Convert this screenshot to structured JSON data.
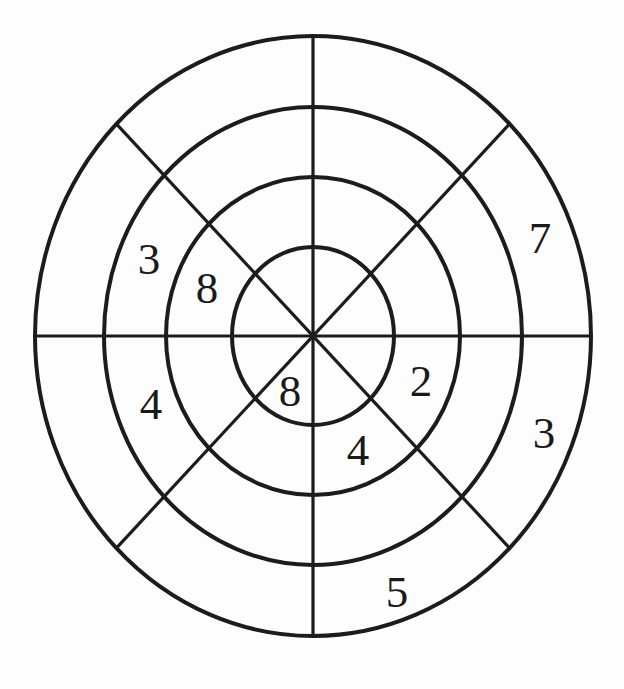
{
  "figure": {
    "type": "concentric-target-diagram",
    "rings": 4,
    "sectors": 8,
    "colors": {
      "line": "#1c1c1c",
      "text": "#1a1a1a",
      "background": "#fdfdfd"
    },
    "labels": [
      {
        "value": "3",
        "ring": 3,
        "sector": "west-northwest",
        "x": 149,
        "y": 259
      },
      {
        "value": "8",
        "ring": 2,
        "sector": "west-northwest",
        "x": 207,
        "y": 288
      },
      {
        "value": "7",
        "ring": 4,
        "sector": "east-northeast",
        "x": 540,
        "y": 238
      },
      {
        "value": "3",
        "ring": 4,
        "sector": "east-southeast",
        "x": 544,
        "y": 433
      },
      {
        "value": "2",
        "ring": 2,
        "sector": "east-southeast",
        "x": 421,
        "y": 381
      },
      {
        "value": "4",
        "ring": 3,
        "sector": "west-southwest",
        "x": 151,
        "y": 404
      },
      {
        "value": "8",
        "ring": 1,
        "sector": "south-southwest",
        "x": 290,
        "y": 391
      },
      {
        "value": "4",
        "ring": 2,
        "sector": "south-southeast",
        "x": 358,
        "y": 450
      },
      {
        "value": "5",
        "ring": 4,
        "sector": "south-southeast",
        "x": 397,
        "y": 592
      }
    ]
  }
}
